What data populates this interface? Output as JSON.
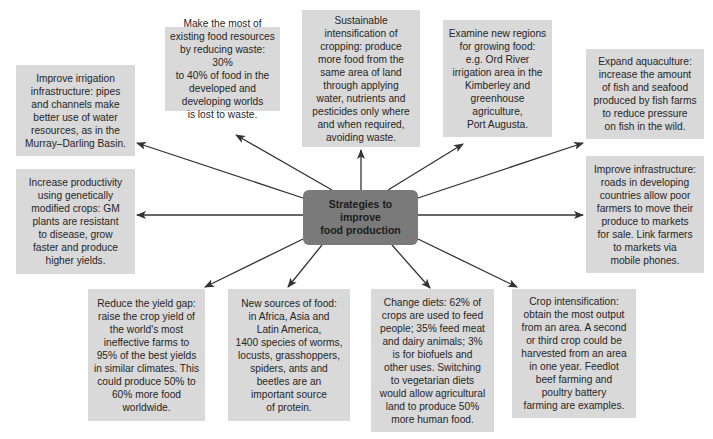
{
  "diagram": {
    "center": {
      "label": "Strategies to\nimprove\nfood production"
    },
    "strategies": [
      {
        "id": "irrigation",
        "text": "Improve irrigation\ninfrastructure: pipes\nand channels make\nbetter use of water\nresources, as in the\nMurray–Darling Basin."
      },
      {
        "id": "waste",
        "text": "Make the most of\nexisting food resources\nby reducing waste: 30%\nto 40% of food in the\ndeveloped and\ndeveloping worlds\nis lost to waste."
      },
      {
        "id": "sustainable",
        "text": "Sustainable\nintensification of\ncropping: produce\nmore food from the\nsame area of land\nthrough applying\nwater, nutrients and\npesticides only where\nand when required,\navoiding waste."
      },
      {
        "id": "new-regions",
        "text": "Examine new regions\nfor growing food:\ne.g. Ord River\nirrigation area in the\nKimberley and\ngreenhouse\nagriculture,\nPort Augusta."
      },
      {
        "id": "aquaculture",
        "text": "Expand aquaculture:\nincrease the amount\nof fish and seafood\nproduced by fish farms\nto reduce pressure\non fish in the wild."
      },
      {
        "id": "gm-crops",
        "text": "Increase productivity\nusing genetically\nmodified crops: GM\nplants are resistant\nto disease, grow\nfaster and produce\nhigher yields."
      },
      {
        "id": "infrastructure",
        "text": "Improve infrastructure:\nroads in developing\ncountries allow poor\nfarmers to move their\nproduce to markets\nfor sale. Link farmers\nto markets via\nmobile phones."
      },
      {
        "id": "yield-gap",
        "text": "Reduce the yield gap:\nraise the crop yield of\nthe world's most\nineffective farms to\n95% of the best yields\nin similar climates. This\ncould produce 50% to\n60% more food\nworldwide."
      },
      {
        "id": "new-sources",
        "text": "New sources of food:\nin Africa, Asia and\nLatin America,\n1400 species of worms,\nlocusts, grasshoppers,\nspiders, ants and\nbeetles are an\nimportant source\nof protein."
      },
      {
        "id": "diets",
        "text": "Change diets: 62% of\ncrops are used to feed\npeople; 35% feed meat\nand dairy animals; 3%\nis for biofuels and\nother uses. Switching\nto vegetarian diets\nwould allow agricultural\nland to produce 50%\nmore human food."
      },
      {
        "id": "crop-intensification",
        "text": "Crop intensification:\nobtain the most output\nfrom an area. A second\nor third crop could be\nharvested from an area\nin one year. Feedlot\nbeef farming and\npoultry battery\nfarming are examples."
      }
    ]
  },
  "colors": {
    "box_fill": "#d9d9d9",
    "center_fill": "#7a7a7a",
    "arrow": "#333333",
    "text": "#262626"
  }
}
